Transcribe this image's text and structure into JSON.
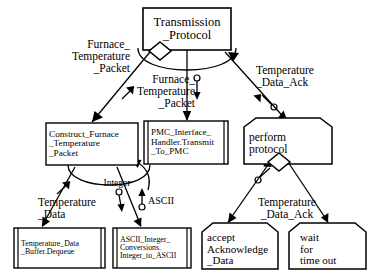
{
  "diagram": {
    "type": "structure-chart",
    "colors": {
      "stroke": "#000000",
      "fill": "#ffffff",
      "text": "#000000"
    },
    "nodes": [
      {
        "id": "transmission_protocol",
        "label": "Transmission\n_Protocol",
        "shape": "rectangle",
        "align": "center",
        "has_loop_ellipse": true,
        "has_diamond": true
      },
      {
        "id": "construct_furnace",
        "label": "Construct_Furnace\n_Temperature\n_Packet",
        "shape": "rectangle",
        "align": "left",
        "has_loop_ellipse": true
      },
      {
        "id": "pmc_interface",
        "label": "PMC_Interface_\nHandler.Transmit\n_To_PMC",
        "shape": "library-module",
        "align": "left"
      },
      {
        "id": "perform_protocol",
        "label": "perform\nprotocol",
        "shape": "clipped-top",
        "align": "left",
        "has_diamond": true
      },
      {
        "id": "temperature_data_buffer",
        "label": "Temperature_Data\n_Buffer.Dequeue",
        "shape": "library-module",
        "align": "left"
      },
      {
        "id": "ascii_integer_conversions",
        "label": "ASCII_Integer_\nConversions.\nInteger_to_ASCII",
        "shape": "library-module",
        "align": "left"
      },
      {
        "id": "accept_acknowledge_data",
        "label": "accept\nAcknowledge\n_Data",
        "shape": "clipped-top",
        "align": "left"
      },
      {
        "id": "wait_for_time_out",
        "label": "wait\nfor\ntime out",
        "shape": "clipped-top",
        "align": "left"
      }
    ],
    "edge_labels": [
      {
        "id": "furnace_temperature_packet_left",
        "text": "Furnace_\nTemperature\n_Packet",
        "align": "right",
        "data_flow": "up"
      },
      {
        "id": "furnace_temperature_packet_mid",
        "text": "Furnace_\nTemperature\n_Packet",
        "align": "right",
        "data_flow": "down"
      },
      {
        "id": "temperature_data_ack_top",
        "text": "Temperature\n_Data_Ack",
        "align": "left",
        "data_flow": "up"
      },
      {
        "id": "temperature_data",
        "text": "Temperature\n_Data",
        "align": "left",
        "data_flow": "up"
      },
      {
        "id": "integer",
        "text": "Integer",
        "align": "center",
        "data_flow": "down"
      },
      {
        "id": "ascii",
        "text": "ASCII",
        "align": "left",
        "data_flow": "up"
      },
      {
        "id": "temperature_data_ack_bottom",
        "text": "Temperature\n_Data_Ack",
        "align": "center",
        "data_flow": "up"
      }
    ]
  }
}
